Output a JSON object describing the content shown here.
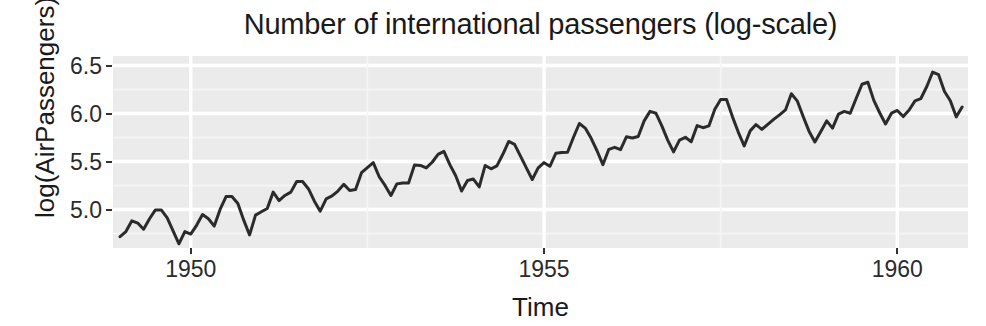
{
  "chart_data": {
    "type": "line",
    "title": "Number of international passengers (log-scale)",
    "xlabel": "Time",
    "ylabel": "log(AirPassengers)",
    "xlim": [
      1948.9,
      1961.0
    ],
    "ylim": [
      4.6,
      6.6
    ],
    "xticks": [
      1950,
      1955,
      1960
    ],
    "xtick_labels": [
      "1950",
      "1955",
      "1960"
    ],
    "yticks": [
      5.0,
      5.5,
      6.0,
      6.5
    ],
    "ytick_labels": [
      "5.0",
      "5.5",
      "6.0",
      "6.5"
    ],
    "grid": true,
    "grid_major_color": "#ffffff",
    "grid_minor_color": "#f5f5f5",
    "panel_background": "#ebebeb",
    "legend": "none",
    "series": [
      {
        "name": "log(AirPassengers)",
        "color": "#2b2b2b",
        "linewidth": 3,
        "x": [
          1949.0,
          1949.083,
          1949.167,
          1949.25,
          1949.333,
          1949.417,
          1949.5,
          1949.583,
          1949.667,
          1949.75,
          1949.833,
          1949.917,
          1950.0,
          1950.083,
          1950.167,
          1950.25,
          1950.333,
          1950.417,
          1950.5,
          1950.583,
          1950.667,
          1950.75,
          1950.833,
          1950.917,
          1951.0,
          1951.083,
          1951.167,
          1951.25,
          1951.333,
          1951.417,
          1951.5,
          1951.583,
          1951.667,
          1951.75,
          1951.833,
          1951.917,
          1952.0,
          1952.083,
          1952.167,
          1952.25,
          1952.333,
          1952.417,
          1952.5,
          1952.583,
          1952.667,
          1952.75,
          1952.833,
          1952.917,
          1953.0,
          1953.083,
          1953.167,
          1953.25,
          1953.333,
          1953.417,
          1953.5,
          1953.583,
          1953.667,
          1953.75,
          1953.833,
          1953.917,
          1954.0,
          1954.083,
          1954.167,
          1954.25,
          1954.333,
          1954.417,
          1954.5,
          1954.583,
          1954.667,
          1954.75,
          1954.833,
          1954.917,
          1955.0,
          1955.083,
          1955.167,
          1955.25,
          1955.333,
          1955.417,
          1955.5,
          1955.583,
          1955.667,
          1955.75,
          1955.833,
          1955.917,
          1956.0,
          1956.083,
          1956.167,
          1956.25,
          1956.333,
          1956.417,
          1956.5,
          1956.583,
          1956.667,
          1956.75,
          1956.833,
          1956.917,
          1957.0,
          1957.083,
          1957.167,
          1957.25,
          1957.333,
          1957.417,
          1957.5,
          1957.583,
          1957.667,
          1957.75,
          1957.833,
          1957.917,
          1958.0,
          1958.083,
          1958.167,
          1958.25,
          1958.333,
          1958.417,
          1958.5,
          1958.583,
          1958.667,
          1958.75,
          1958.833,
          1958.917,
          1959.0,
          1959.083,
          1959.167,
          1959.25,
          1959.333,
          1959.417,
          1959.5,
          1959.583,
          1959.667,
          1959.75,
          1959.833,
          1959.917,
          1960.0,
          1960.083,
          1960.167,
          1960.25,
          1960.333,
          1960.417,
          1960.5,
          1960.583,
          1960.667,
          1960.75,
          1960.833,
          1960.917
        ],
        "y": [
          4.718,
          4.771,
          4.883,
          4.86,
          4.796,
          4.905,
          4.997,
          4.997,
          4.913,
          4.779,
          4.644,
          4.771,
          4.745,
          4.836,
          4.949,
          4.905,
          4.828,
          5.004,
          5.136,
          5.136,
          5.063,
          4.89,
          4.736,
          4.942,
          4.977,
          5.011,
          5.182,
          5.094,
          5.147,
          5.182,
          5.293,
          5.293,
          5.215,
          5.088,
          4.984,
          5.112,
          5.142,
          5.193,
          5.263,
          5.199,
          5.209,
          5.384,
          5.438,
          5.489,
          5.342,
          5.252,
          5.147,
          5.268,
          5.278,
          5.278,
          5.464,
          5.46,
          5.434,
          5.493,
          5.575,
          5.606,
          5.468,
          5.352,
          5.193,
          5.303,
          5.318,
          5.236,
          5.46,
          5.425,
          5.455,
          5.576,
          5.71,
          5.68,
          5.557,
          5.434,
          5.313,
          5.434,
          5.489,
          5.451,
          5.587,
          5.595,
          5.598,
          5.753,
          5.897,
          5.849,
          5.743,
          5.613,
          5.468,
          5.628,
          5.649,
          5.624,
          5.759,
          5.746,
          5.762,
          5.924,
          6.023,
          6.004,
          5.872,
          5.724,
          5.602,
          5.724,
          5.753,
          5.707,
          5.875,
          5.853,
          5.872,
          6.045,
          6.146,
          6.146,
          5.966,
          5.805,
          5.663,
          5.82,
          5.886,
          5.835,
          5.889,
          5.94,
          5.987,
          6.038,
          6.207,
          6.133,
          5.969,
          5.817,
          5.704,
          5.814,
          5.924,
          5.849,
          5.994,
          6.023,
          6.004,
          6.157,
          6.306,
          6.326,
          6.138,
          6.009,
          5.892,
          6.004,
          6.033,
          5.969,
          6.038,
          6.133,
          6.157,
          6.282,
          6.433,
          6.407,
          6.23,
          6.134,
          5.966,
          6.068
        ]
      }
    ]
  },
  "axes": {
    "title": "Number of international passengers (log-scale)",
    "y_title": "log(AirPassengers)",
    "x_title": "Time"
  }
}
